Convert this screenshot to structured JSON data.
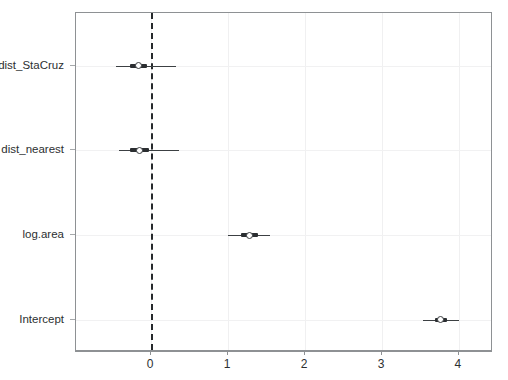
{
  "chart_data": {
    "type": "scatter",
    "subtype": "coefficient-forest-plot",
    "title": "",
    "subtitle": "",
    "xlabel": "",
    "ylabel": "",
    "xlim": [
      -0.974,
      4.442
    ],
    "xticks": [
      0,
      1,
      2,
      3,
      4
    ],
    "xticklabels": [
      "0",
      "1",
      "2",
      "3",
      "4"
    ],
    "categories": [
      "dist_StaCruz",
      "dist_nearest",
      "log.area",
      "Intercept"
    ],
    "grid": "light-gray-both-axes",
    "legend": "none",
    "reference_line": {
      "value": 0,
      "style": "dashed",
      "color": "#26292c",
      "width": 2
    },
    "point_marker": {
      "shape": "open-circle",
      "fill": "#ffffff",
      "edge_color": "#3a3d40"
    },
    "interval_colors": {
      "outer": "#3c4043",
      "inner": "#2b2e31"
    },
    "points": [
      {
        "label": "dist_StaCruz",
        "estimate": -0.16,
        "outer_low": -0.45,
        "outer_high": 0.33,
        "inner_low": -0.27,
        "inner_high": -0.05
      },
      {
        "label": "dist_nearest",
        "estimate": -0.15,
        "outer_low": -0.42,
        "outer_high": 0.36,
        "inner_low": -0.27,
        "inner_high": -0.03
      },
      {
        "label": "log.area",
        "estimate": 1.28,
        "outer_low": 1.0,
        "outer_high": 1.55,
        "inner_low": 1.17,
        "inner_high": 1.39
      },
      {
        "label": "Intercept",
        "estimate": 3.76,
        "outer_low": 3.53,
        "outer_high": 4.0,
        "inner_low": 3.69,
        "inner_high": 3.84
      }
    ]
  }
}
